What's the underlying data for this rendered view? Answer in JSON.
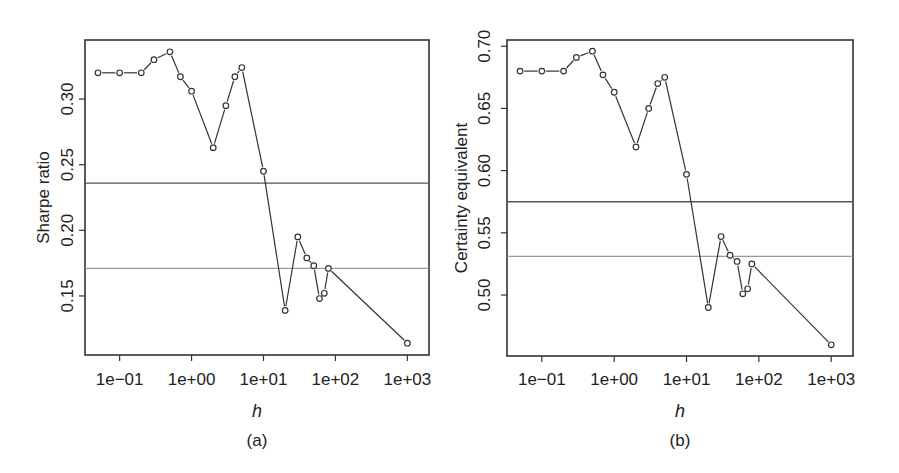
{
  "chart_data": [
    {
      "type": "line",
      "panel_label": "(a)",
      "title": "",
      "xlabel": "h",
      "ylabel": "Sharpe ratio",
      "x_scale": "log",
      "xlim": [
        0.033,
        2000
      ],
      "ylim": [
        0.105,
        0.345
      ],
      "x_ticks": [
        0.1,
        1,
        10,
        100,
        1000
      ],
      "x_tick_labels": [
        "1e−01",
        "1e+00",
        "1e+01",
        "1e+02",
        "1e+03"
      ],
      "y_ticks": [
        0.15,
        0.2,
        0.25,
        0.3
      ],
      "y_tick_labels": [
        "0.15",
        "0.20",
        "0.25",
        "0.30"
      ],
      "grid": false,
      "legend": null,
      "marker": "open-circle",
      "series": [
        {
          "name": "Sharpe ratio vs h",
          "x": [
            0.05,
            0.1,
            0.2,
            0.3,
            0.5,
            0.7,
            1,
            2,
            3,
            4,
            5,
            10,
            20,
            30,
            40,
            50,
            60,
            70,
            80,
            1000
          ],
          "values": [
            0.32,
            0.32,
            0.32,
            0.33,
            0.336,
            0.317,
            0.306,
            0.263,
            0.295,
            0.317,
            0.324,
            0.245,
            0.139,
            0.195,
            0.179,
            0.173,
            0.148,
            0.152,
            0.171,
            0.114
          ]
        }
      ],
      "reference_lines": [
        {
          "y": 0.236,
          "color": "#555555"
        },
        {
          "y": 0.171,
          "color": "#999999"
        }
      ],
      "layout": {
        "left": 85,
        "top": 40,
        "right": 429,
        "bottom": 355,
        "ylabel_x": 43,
        "ticklabel_x": 67,
        "ticklabel_y": 385,
        "xlabel_y": 417,
        "panel_y": 446
      }
    },
    {
      "type": "line",
      "panel_label": "(b)",
      "title": "",
      "xlabel": "h",
      "ylabel": "Certainty equivalent",
      "x_scale": "log",
      "xlim": [
        0.033,
        2000
      ],
      "ylim": [
        0.451,
        0.705
      ],
      "x_ticks": [
        0.1,
        1,
        10,
        100,
        1000
      ],
      "x_tick_labels": [
        "1e−01",
        "1e+00",
        "1e+01",
        "1e+02",
        "1e+03"
      ],
      "y_ticks": [
        0.5,
        0.55,
        0.6,
        0.65,
        0.7
      ],
      "y_tick_labels": [
        "0.50",
        "0.55",
        "0.60",
        "0.65",
        "0.70"
      ],
      "grid": false,
      "legend": null,
      "marker": "open-circle",
      "series": [
        {
          "name": "Certainty equivalent vs h",
          "x": [
            0.05,
            0.1,
            0.2,
            0.3,
            0.5,
            0.7,
            1,
            2,
            3,
            4,
            5,
            10,
            20,
            30,
            40,
            50,
            60,
            70,
            80,
            1000
          ],
          "values": [
            0.68,
            0.68,
            0.68,
            0.691,
            0.696,
            0.677,
            0.663,
            0.619,
            0.65,
            0.67,
            0.675,
            0.597,
            0.49,
            0.547,
            0.532,
            0.527,
            0.501,
            0.505,
            0.525,
            0.46
          ]
        }
      ],
      "reference_lines": [
        {
          "y": 0.575,
          "color": "#555555"
        },
        {
          "y": 0.531,
          "color": "#999999"
        }
      ],
      "layout": {
        "left": 507,
        "top": 40,
        "right": 853,
        "bottom": 356,
        "ylabel_x": 461,
        "ticklabel_x": 484,
        "ticklabel_y": 385,
        "xlabel_y": 417,
        "panel_y": 446
      }
    }
  ]
}
